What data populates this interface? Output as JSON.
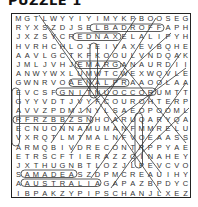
{
  "title": "PUZZLE 1",
  "grid": [
    [
      "M",
      "G",
      "T",
      "L",
      "W",
      "Y",
      "Y",
      "I",
      "Y",
      "I",
      "M",
      "Y",
      "K",
      "P",
      "B",
      "O",
      "O",
      "S",
      "E",
      "G"
    ],
    [
      "R",
      "Y",
      "X",
      "S",
      "Z",
      "D",
      "J",
      "S",
      "E",
      "L",
      "B",
      "A",
      "D",
      "R",
      "O",
      "F",
      "F",
      "A",
      "P",
      "H"
    ],
    [
      "J",
      "X",
      "Z",
      "S",
      "Y",
      "C",
      "R",
      "E",
      "D",
      "N",
      "A",
      "X",
      "E",
      "L",
      "A",
      "L",
      "I",
      "P",
      "Y",
      "H"
    ],
    [
      "H",
      "V",
      "R",
      "H",
      "C",
      "H",
      "L",
      "O",
      "J",
      "E",
      "I",
      "V",
      "A",
      "X",
      "E",
      "V",
      "B",
      "Q",
      "H",
      "E"
    ],
    [
      "A",
      "A",
      "V",
      "L",
      "G",
      "C",
      "T",
      "K",
      "F",
      "K",
      "O",
      "O",
      "U",
      "L",
      "V",
      "N",
      "D",
      "Q",
      "A",
      "K"
    ],
    [
      "J",
      "M",
      "L",
      "J",
      "V",
      "H",
      "J",
      "E",
      "M",
      "A",
      "R",
      "G",
      "A",
      "N",
      "A",
      "U",
      "R",
      "D",
      "I",
      "I"
    ],
    [
      "A",
      "N",
      "W",
      "Y",
      "W",
      "X",
      "L",
      "U",
      "M",
      "W",
      "T",
      "C",
      "W",
      "E",
      "X",
      "W",
      "Q",
      "V",
      "L",
      "E"
    ],
    [
      "G",
      "W",
      "N",
      "R",
      "V",
      "O",
      "A",
      "E",
      "N",
      "A",
      "L",
      "P",
      "R",
      "A",
      "A",
      "O",
      "O",
      "L",
      "A",
      "A"
    ],
    [
      "E",
      "V",
      "C",
      "S",
      "F",
      "G",
      "N",
      "I",
      "T",
      "N",
      "U",
      "O",
      "C",
      "C",
      "O",
      "R",
      "U",
      "M",
      "T",
      "T"
    ],
    [
      "G",
      "Y",
      "Y",
      "V",
      "D",
      "T",
      "J",
      "V",
      "Y",
      "F",
      "C",
      "O",
      "U",
      "R",
      "O",
      "H",
      "T",
      "E",
      "R",
      "P"
    ],
    [
      "A",
      "V",
      "V",
      "Z",
      "P",
      "D",
      "M",
      "J",
      "N",
      "Y",
      "L",
      "S",
      "A",
      "E",
      "O",
      "P",
      "O",
      "O",
      "M",
      "L"
    ],
    [
      "R",
      "F",
      "R",
      "Z",
      "B",
      "B",
      "Z",
      "S",
      "N",
      "H",
      "O",
      "A",
      "R",
      "U",
      "Q",
      "A",
      "R",
      "Y",
      "Q",
      "A"
    ],
    [
      "E",
      "C",
      "N",
      "U",
      "O",
      "N",
      "N",
      "A",
      "M",
      "U",
      "M",
      "A",
      "N",
      "F",
      "M",
      "M",
      "R",
      "E",
      "L",
      "U"
    ],
    [
      "V",
      "X",
      "R",
      "Q",
      "T",
      "L",
      "M",
      "T",
      "M",
      "A",
      "L",
      "N",
      "F",
      "V",
      "O",
      "E",
      "A",
      "A",
      "S",
      "S"
    ],
    [
      "A",
      "R",
      "M",
      "Q",
      "B",
      "I",
      "V",
      "D",
      "R",
      "E",
      "C",
      "O",
      "N",
      "T",
      "R",
      "P",
      "P",
      "Y",
      "A",
      "E"
    ],
    [
      "E",
      "T",
      "R",
      "S",
      "C",
      "F",
      "T",
      "I",
      "E",
      "R",
      "A",
      "Z",
      "Z",
      "C",
      "I",
      "N",
      "A",
      "H",
      "E",
      "Y"
    ],
    [
      "J",
      "X",
      "T",
      "H",
      "U",
      "G",
      "N",
      "B",
      "T",
      "L",
      "O",
      "Z",
      "J",
      "L",
      "P",
      "E",
      "V",
      "C",
      "V",
      "O"
    ],
    [
      "S",
      "A",
      "M",
      "A",
      "D",
      "E",
      "A",
      "S",
      "Z",
      "D",
      "P",
      "M",
      "C",
      "R",
      "E",
      "A",
      "U",
      "I",
      "H",
      "Y"
    ],
    [
      "A",
      "A",
      "U",
      "S",
      "T",
      "R",
      "A",
      "L",
      "I",
      "A",
      "G",
      "A",
      "P",
      "A",
      "Z",
      "B",
      "P",
      "D",
      "Y",
      "C"
    ],
    [
      "I",
      "B",
      "P",
      "A",
      "K",
      "Z",
      "Y",
      "P",
      "I",
      "P",
      "S",
      "C",
      "H",
      "A",
      "N",
      "J",
      "L",
      "X",
      "E",
      "Z"
    ]
  ],
  "found_words": [
    "ELBADROFFA",
    "REDNAXELA",
    "GNITNUOCCOR",
    "ENNOUNCE",
    "AMADEAS",
    "AUSTRALIA",
    "MARGANA",
    "ENALPRA"
  ]
}
